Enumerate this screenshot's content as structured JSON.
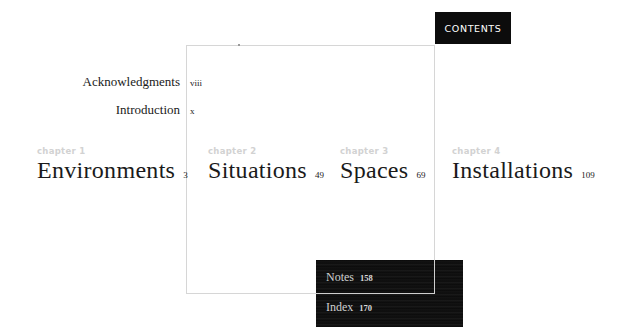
{
  "header": {
    "contents_label": "CONTENTS"
  },
  "front_matter": [
    {
      "label": "Acknowledgments",
      "page": "viii"
    },
    {
      "label": "Introduction",
      "page": "x"
    }
  ],
  "chapters": [
    {
      "kicker": "chapter 1",
      "title": "Environments",
      "page": "3"
    },
    {
      "kicker": "chapter 2",
      "title": "Situations",
      "page": "49"
    },
    {
      "kicker": "chapter 3",
      "title": "Spaces",
      "page": "69"
    },
    {
      "kicker": "chapter 4",
      "title": "Installations",
      "page": "109"
    }
  ],
  "back_matter": [
    {
      "label": "Notes",
      "page": "158"
    },
    {
      "label": "Index",
      "page": "170"
    }
  ]
}
